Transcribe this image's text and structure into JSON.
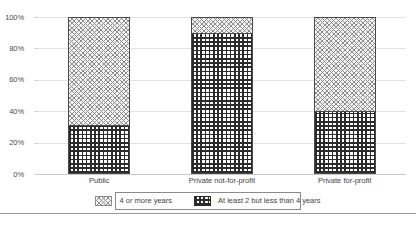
{
  "chart_data": {
    "type": "bar",
    "subtype": "stacked-percent-bar",
    "title": "",
    "xlabel": "",
    "ylabel": "",
    "ylim": [
      0,
      100
    ],
    "ytick_labels": [
      "100%",
      "80%",
      "60%",
      "40%",
      "20%",
      "0%"
    ],
    "ytick_values": [
      100,
      80,
      60,
      40,
      20,
      0
    ],
    "grid": true,
    "legend_position": "bottom-center",
    "categories": [
      "Public",
      "Private not-for-profit",
      "Private for-profit"
    ],
    "series": [
      {
        "name": "4 or more years",
        "values": [
          69,
          10,
          60
        ],
        "pattern": "diagonal-crosshatch"
      },
      {
        "name": "At least 2 but less than 4 years",
        "values": [
          31,
          90,
          40
        ],
        "pattern": "dense-grid"
      }
    ]
  },
  "axis": {
    "ticks": [
      {
        "label": "100%",
        "value": 100
      },
      {
        "label": "80%",
        "value": 80
      },
      {
        "label": "60%",
        "value": 60
      },
      {
        "label": "40%",
        "value": 40
      },
      {
        "label": "20%",
        "value": 20
      },
      {
        "label": "0%",
        "value": 0
      }
    ]
  },
  "bars": [
    {
      "category": "Public",
      "top_label": "4 or more years",
      "top_value": 69,
      "bottom_label": "At least 2 but less than 4 years",
      "bottom_value": 31
    },
    {
      "category": "Private not-for-profit",
      "top_label": "4 or more years",
      "top_value": 10,
      "bottom_label": "At least 2 but less than 4 years",
      "bottom_value": 90
    },
    {
      "category": "Private for-profit",
      "top_label": "4 or more years",
      "top_value": 60,
      "bottom_label": "At least 2 but less than 4 years",
      "bottom_value": 40
    }
  ],
  "legend": {
    "items": [
      {
        "label": "4 or more years",
        "pattern": "diagonal-crosshatch"
      },
      {
        "label": "At least 2 but less than 4 years",
        "pattern": "dense-grid"
      }
    ]
  },
  "footer": {
    "note": ""
  },
  "colors": {
    "gridline": "#e2e2e2",
    "baseline": "#c9c9c9",
    "bar_outline": "#4a4a4a",
    "hatch_light": "#8d8d8d",
    "hatch_dark": "#2b2b2b",
    "text": "#3f3f3f"
  }
}
